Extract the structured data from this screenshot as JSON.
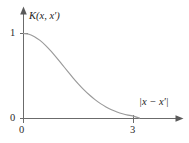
{
  "figure": {
    "name": "kernel-function-plot",
    "background_color": "#ffffff"
  },
  "axes": {
    "y_axis_label": "K(x, x′)",
    "x_axis_label": "|x − x′|",
    "axis_color": "#6b6b6b",
    "x_ticks": [
      "0",
      "3"
    ],
    "y_ticks": [
      "0",
      "1"
    ]
  },
  "labels": {
    "y_top": "1",
    "y_bottom": "0",
    "x_origin": "0",
    "x_right": "3"
  },
  "chart_data": {
    "type": "line",
    "title": "",
    "subtitle": "",
    "xlabel": "|x − x′|",
    "ylabel": "K(x, x′)",
    "xlim": [
      0,
      3.55
    ],
    "ylim": [
      0,
      1.12
    ],
    "xticks": [
      0,
      3
    ],
    "xticklabels": [
      "0",
      "3"
    ],
    "yticks": [
      0,
      1
    ],
    "yticklabels": [
      "0",
      "1"
    ],
    "grid": false,
    "legend": null,
    "annotations": [],
    "series": [
      {
        "name": "Gaussian kernel",
        "color": "#9a9a9a",
        "description": "Squared-exponential covariance decaying from 1 at zero separation to ~0 near separation 3",
        "x": [
          0,
          0.15,
          0.3,
          0.45,
          0.6,
          0.75,
          0.9,
          1.05,
          1.2,
          1.35,
          1.5,
          1.65,
          1.8,
          1.95,
          2.1,
          2.25,
          2.4,
          2.55,
          2.7,
          2.85,
          3.0
        ],
        "y": [
          1.0,
          0.991,
          0.963,
          0.919,
          0.861,
          0.792,
          0.716,
          0.637,
          0.557,
          0.479,
          0.405,
          0.337,
          0.276,
          0.222,
          0.175,
          0.136,
          0.103,
          0.077,
          0.056,
          0.04,
          0.028
        ]
      }
    ]
  }
}
